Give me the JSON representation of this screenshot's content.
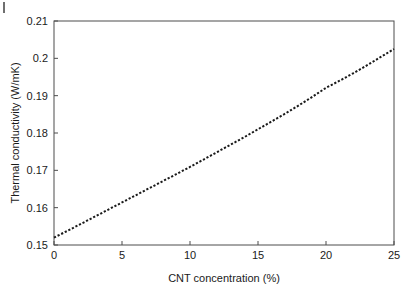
{
  "figure": {
    "background_color": "#ffffff",
    "axis_color": "#4d4d4d",
    "series_color": "#1a1a1a",
    "corner_mark": ""
  },
  "chart_data": {
    "type": "line",
    "title": "",
    "xlabel": "CNT concentration (%)",
    "ylabel": "Thermal conductivity (W/mK)",
    "xlim": [
      0,
      25
    ],
    "ylim": [
      0.15,
      0.21
    ],
    "grid": false,
    "legend": null,
    "line_style": "dotted",
    "xticks": [
      0,
      5,
      10,
      15,
      20,
      25
    ],
    "xticklabels": [
      "0",
      "5",
      "10",
      "15",
      "20",
      "25"
    ],
    "yticks": [
      0.15,
      0.16,
      0.17,
      0.18,
      0.19,
      0.2,
      0.21
    ],
    "yticklabels": [
      "0.15",
      "0.16",
      "0.17",
      "0.18",
      "0.19",
      "0.2",
      "0.21"
    ],
    "series": [
      {
        "name": "Thermal conductivity vs CNT concentration",
        "x": [
          0,
          1,
          2,
          3,
          4,
          5,
          6,
          7,
          8,
          9,
          10,
          11,
          12,
          13,
          14,
          15,
          16,
          17,
          18,
          19,
          20,
          21,
          22,
          23,
          24,
          25
        ],
        "y": [
          0.152,
          0.1538,
          0.1557,
          0.1576,
          0.1595,
          0.1614,
          0.1633,
          0.1652,
          0.1671,
          0.169,
          0.1709,
          0.1729,
          0.1749,
          0.1769,
          0.1789,
          0.181,
          0.1831,
          0.1852,
          0.1874,
          0.1897,
          0.1921,
          0.194,
          0.196,
          0.1981,
          0.2003,
          0.2025
        ]
      }
    ]
  }
}
